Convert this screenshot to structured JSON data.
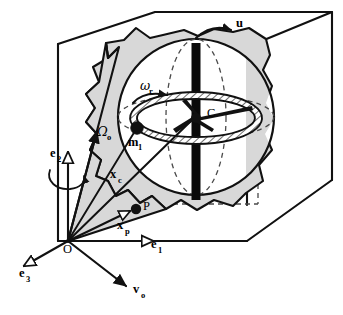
{
  "figure": {
    "name": "gyroscopic-rotor-in-cube-diagram"
  },
  "colors": {
    "ink": "#111111",
    "shade_gray": "#d8d8d8",
    "shade_gray_dark": "#bdbdbd",
    "shaft_black": "#0a0a0a",
    "paper": "#ffffff",
    "hidden_line": "#4a4a4a"
  },
  "labels": {
    "u": {
      "text": "u",
      "sub": "",
      "x": 236,
      "y": 27,
      "kind": "vector"
    },
    "omega_r": {
      "text": "ω",
      "sub": "r",
      "x": 140,
      "y": 90,
      "kind": "angular-rate"
    },
    "C": {
      "text": "C",
      "sub": "",
      "x": 207,
      "y": 117,
      "kind": "point"
    },
    "m1": {
      "text": "m",
      "sub": "1",
      "x": 128,
      "y": 146,
      "kind": "mass"
    },
    "Omega_o": {
      "text": "Ω",
      "sub": "o",
      "x": 97,
      "y": 136,
      "kind": "angular-rate"
    },
    "e2": {
      "text": "e",
      "sub": "2",
      "x": 50,
      "y": 157,
      "kind": "basis-vector"
    },
    "xc": {
      "text": "x",
      "sub": "c",
      "x": 110,
      "y": 178,
      "kind": "position-vector"
    },
    "P": {
      "text": "P",
      "sub": "",
      "x": 143,
      "y": 210,
      "kind": "point"
    },
    "xp": {
      "text": "x",
      "sub": "p",
      "x": 117,
      "y": 229,
      "kind": "position-vector"
    },
    "e1": {
      "text": "e",
      "sub": "1",
      "x": 151,
      "y": 248,
      "kind": "basis-vector"
    },
    "O": {
      "text": "O",
      "sub": "",
      "x": 63,
      "y": 249,
      "kind": "origin"
    },
    "e3": {
      "text": "e",
      "sub": "3",
      "x": 19,
      "y": 274,
      "kind": "basis-vector"
    },
    "vo": {
      "text": "v",
      "sub": "o",
      "x": 133,
      "y": 290,
      "kind": "velocity-vector"
    }
  },
  "geometry": {
    "origin": {
      "x": 68,
      "y": 241
    },
    "sphere_center": {
      "x": 196,
      "y": 117
    },
    "sphere_radius": 78,
    "rotor_center": {
      "x": 196,
      "y": 118
    },
    "mass_point": {
      "x": 137,
      "y": 128
    },
    "point_P": {
      "x": 136,
      "y": 209
    },
    "shaft_top": {
      "x": 196,
      "y": 43
    },
    "shaft_bottom": {
      "x": 196,
      "y": 200
    }
  }
}
